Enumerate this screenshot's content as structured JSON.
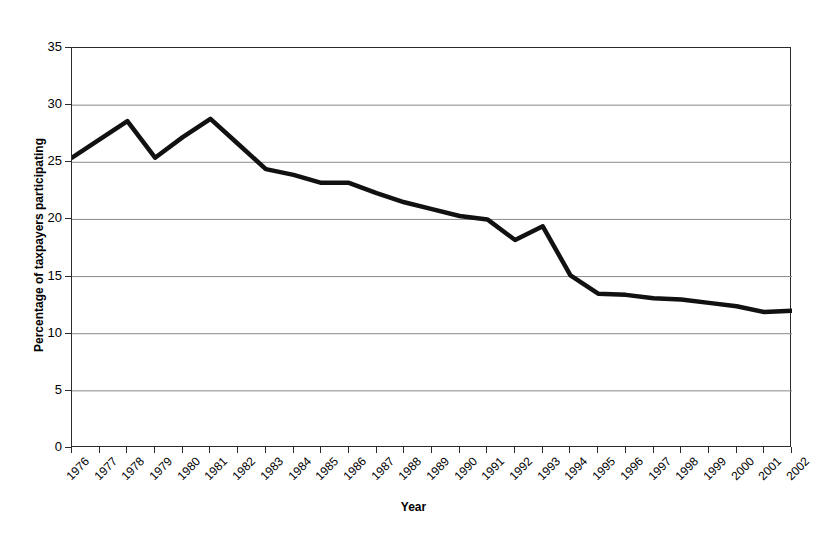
{
  "chart_data": {
    "type": "line",
    "title": "",
    "xlabel": "Year",
    "ylabel": "Percentage of taxpayers participating",
    "categories": [
      "1976",
      "1977",
      "1978",
      "1979",
      "1980",
      "1981",
      "1982",
      "1983",
      "1984",
      "1985",
      "1986",
      "1987",
      "1988",
      "1989",
      "1990",
      "1991",
      "1992",
      "1993",
      "1994",
      "1995",
      "1996",
      "1997",
      "1998",
      "1999",
      "2000",
      "2001",
      "2002"
    ],
    "values": [
      25.4,
      27.0,
      28.6,
      25.4,
      27.2,
      28.8,
      26.6,
      24.4,
      23.9,
      23.2,
      23.2,
      22.3,
      21.5,
      20.9,
      20.3,
      20.0,
      18.2,
      19.4,
      15.1,
      13.5,
      13.4,
      13.1,
      13.0,
      12.7,
      12.4,
      11.9,
      12.0
    ],
    "ylim": [
      0,
      35
    ],
    "ytick_labels": [
      "0",
      "5",
      "10",
      "15",
      "20",
      "25",
      "30",
      "35"
    ],
    "ytick_values": [
      0,
      5,
      10,
      15,
      20,
      25,
      30,
      35
    ],
    "grid": "horizontal",
    "legend": "none",
    "line_color": "#111111",
    "grid_color": "#8a8a8a",
    "axis_color": "#2b2b2b",
    "background": "#ffffff"
  }
}
